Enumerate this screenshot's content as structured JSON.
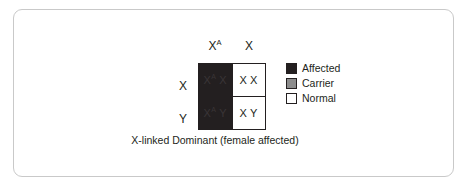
{
  "figure": {
    "caption": "X-linked Dominant (female affected)",
    "colors": {
      "affected": "#231f20",
      "carrier": "#8c8c8c",
      "normal": "#ffffff",
      "border": "#231f20",
      "frame": "#c9c9c9",
      "text": "#231f20"
    }
  },
  "punnett": {
    "column_headers": [
      {
        "base": "X",
        "sup": "A"
      },
      {
        "base": "X",
        "sup": ""
      }
    ],
    "row_headers": [
      {
        "base": "X",
        "sup": ""
      },
      {
        "base": "Y",
        "sup": ""
      }
    ],
    "cells": [
      {
        "id": "cell-0-0",
        "genotype": "X^A X",
        "left_allele": "X",
        "left_sup": "A",
        "right_allele": "X",
        "right_sup": "",
        "status": "affected"
      },
      {
        "id": "cell-0-1",
        "genotype": "X X",
        "left_allele": "X",
        "left_sup": "",
        "right_allele": "X",
        "right_sup": "",
        "status": "normal"
      },
      {
        "id": "cell-1-0",
        "genotype": "X^A Y",
        "left_allele": "X",
        "left_sup": "A",
        "right_allele": "Y",
        "right_sup": "",
        "status": "affected"
      },
      {
        "id": "cell-1-1",
        "genotype": "X Y",
        "left_allele": "X",
        "left_sup": "",
        "right_allele": "Y",
        "right_sup": "",
        "status": "normal"
      }
    ]
  },
  "legend": {
    "items": [
      {
        "label": "Affected",
        "color": "#231f20"
      },
      {
        "label": "Carrier",
        "color": "#8c8c8c"
      },
      {
        "label": "Normal",
        "color": "#ffffff"
      }
    ]
  }
}
